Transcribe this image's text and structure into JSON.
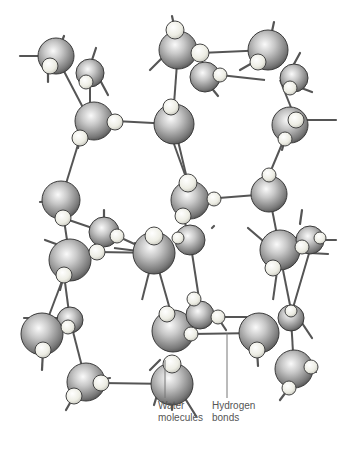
{
  "figure": {
    "labels": {
      "water_molecules": [
        "Water",
        "molecules"
      ],
      "hydrogen_bonds": [
        "Hydrogen",
        "bonds"
      ]
    },
    "colors": {
      "oxygen_light": "#f2f2f2",
      "oxygen_dark": "#555555",
      "hydrogen_light": "#f5f5ee",
      "hydrogen_dark": "#c8c8c0",
      "bond": "#555555",
      "leader_line": "#777777"
    },
    "oxygens": [
      {
        "x": 56,
        "y": 56,
        "r": 18
      },
      {
        "x": 90,
        "y": 73,
        "r": 14
      },
      {
        "x": 94,
        "y": 121,
        "r": 19
      },
      {
        "x": 178,
        "y": 50,
        "r": 19
      },
      {
        "x": 205,
        "y": 77,
        "r": 15
      },
      {
        "x": 268,
        "y": 50,
        "r": 20
      },
      {
        "x": 294,
        "y": 78,
        "r": 14
      },
      {
        "x": 174,
        "y": 124,
        "r": 20
      },
      {
        "x": 290,
        "y": 125,
        "r": 18
      },
      {
        "x": 61,
        "y": 200,
        "r": 19
      },
      {
        "x": 104,
        "y": 232,
        "r": 15
      },
      {
        "x": 70,
        "y": 260,
        "r": 21
      },
      {
        "x": 154,
        "y": 253,
        "r": 21
      },
      {
        "x": 190,
        "y": 200,
        "r": 19
      },
      {
        "x": 269,
        "y": 194,
        "r": 18
      },
      {
        "x": 190,
        "y": 240,
        "r": 15
      },
      {
        "x": 280,
        "y": 250,
        "r": 20
      },
      {
        "x": 310,
        "y": 240,
        "r": 14
      },
      {
        "x": 70,
        "y": 320,
        "r": 13
      },
      {
        "x": 42,
        "y": 334,
        "r": 21
      },
      {
        "x": 86,
        "y": 382,
        "r": 19
      },
      {
        "x": 173,
        "y": 331,
        "r": 21
      },
      {
        "x": 200,
        "y": 315,
        "r": 14
      },
      {
        "x": 259,
        "y": 333,
        "r": 20
      },
      {
        "x": 172,
        "y": 384,
        "r": 21
      },
      {
        "x": 294,
        "y": 369,
        "r": 19
      },
      {
        "x": 291,
        "y": 318,
        "r": 13
      }
    ],
    "hydrogens": [
      {
        "x": 50,
        "y": 66,
        "r": 8
      },
      {
        "x": 86,
        "y": 82,
        "r": 7
      },
      {
        "x": 115,
        "y": 122,
        "r": 8
      },
      {
        "x": 80,
        "y": 138,
        "r": 8
      },
      {
        "x": 175,
        "y": 30,
        "r": 9
      },
      {
        "x": 200,
        "y": 53,
        "r": 9
      },
      {
        "x": 220,
        "y": 75,
        "r": 7
      },
      {
        "x": 258,
        "y": 62,
        "r": 8
      },
      {
        "x": 290,
        "y": 88,
        "r": 7
      },
      {
        "x": 171,
        "y": 107,
        "r": 8
      },
      {
        "x": 296,
        "y": 120,
        "r": 8
      },
      {
        "x": 285,
        "y": 139,
        "r": 7
      },
      {
        "x": 188,
        "y": 183,
        "r": 9
      },
      {
        "x": 214,
        "y": 199,
        "r": 7
      },
      {
        "x": 269,
        "y": 175,
        "r": 7
      },
      {
        "x": 63,
        "y": 218,
        "r": 8
      },
      {
        "x": 117,
        "y": 236,
        "r": 7
      },
      {
        "x": 97,
        "y": 252,
        "r": 8
      },
      {
        "x": 64,
        "y": 275,
        "r": 8
      },
      {
        "x": 154,
        "y": 236,
        "r": 9
      },
      {
        "x": 178,
        "y": 238,
        "r": 6
      },
      {
        "x": 273,
        "y": 268,
        "r": 8
      },
      {
        "x": 302,
        "y": 247,
        "r": 7
      },
      {
        "x": 320,
        "y": 238,
        "r": 6
      },
      {
        "x": 183,
        "y": 216,
        "r": 8
      },
      {
        "x": 68,
        "y": 327,
        "r": 7
      },
      {
        "x": 43,
        "y": 350,
        "r": 8
      },
      {
        "x": 101,
        "y": 383,
        "r": 8
      },
      {
        "x": 74,
        "y": 396,
        "r": 8
      },
      {
        "x": 167,
        "y": 314,
        "r": 8
      },
      {
        "x": 194,
        "y": 299,
        "r": 7
      },
      {
        "x": 218,
        "y": 317,
        "r": 7
      },
      {
        "x": 191,
        "y": 334,
        "r": 7
      },
      {
        "x": 257,
        "y": 350,
        "r": 8
      },
      {
        "x": 172,
        "y": 364,
        "r": 9
      },
      {
        "x": 291,
        "y": 311,
        "r": 6
      },
      {
        "x": 311,
        "y": 367,
        "r": 7
      },
      {
        "x": 289,
        "y": 388,
        "r": 7
      }
    ],
    "bonds": [
      [
        56,
        56,
        90,
        121
      ],
      [
        90,
        82,
        90,
        121
      ],
      [
        115,
        121,
        172,
        124
      ],
      [
        174,
        104,
        178,
        50
      ],
      [
        200,
        53,
        268,
        50
      ],
      [
        220,
        75,
        265,
        80
      ],
      [
        280,
        80,
        294,
        115
      ],
      [
        174,
        124,
        188,
        183
      ],
      [
        269,
        175,
        290,
        125
      ],
      [
        80,
        138,
        61,
        200
      ],
      [
        117,
        236,
        154,
        253
      ],
      [
        104,
        232,
        63,
        218
      ],
      [
        154,
        253,
        173,
        320
      ],
      [
        206,
        199,
        269,
        194
      ],
      [
        188,
        183,
        174,
        144
      ],
      [
        190,
        240,
        183,
        216
      ],
      [
        269,
        194,
        280,
        250
      ],
      [
        114,
        248,
        154,
        253
      ],
      [
        97,
        252,
        160,
        253
      ],
      [
        61,
        200,
        70,
        260
      ],
      [
        64,
        275,
        70,
        320
      ],
      [
        70,
        260,
        42,
        334
      ],
      [
        70,
        320,
        86,
        382
      ],
      [
        101,
        383,
        172,
        384
      ],
      [
        218,
        317,
        259,
        317
      ],
      [
        191,
        334,
        259,
        333
      ],
      [
        280,
        250,
        273,
        300
      ],
      [
        310,
        250,
        290,
        318
      ],
      [
        291,
        318,
        294,
        369
      ],
      [
        190,
        240,
        200,
        305
      ],
      [
        154,
        253,
        142,
        300
      ],
      [
        283,
        270,
        295,
        330
      ]
    ],
    "stubs": [
      [
        56,
        56,
        64,
        36
      ],
      [
        38,
        56,
        20,
        56
      ],
      [
        48,
        70,
        48,
        82
      ],
      [
        92,
        60,
        96,
        48
      ],
      [
        100,
        80,
        108,
        95
      ],
      [
        80,
        138,
        78,
        148
      ],
      [
        175,
        30,
        172,
        16
      ],
      [
        162,
        58,
        150,
        70
      ],
      [
        210,
        86,
        218,
        96
      ],
      [
        268,
        50,
        274,
        22
      ],
      [
        254,
        62,
        240,
        70
      ],
      [
        294,
        64,
        300,
        53
      ],
      [
        296,
        86,
        312,
        92
      ],
      [
        304,
        120,
        336,
        120
      ],
      [
        285,
        139,
        282,
        150
      ],
      [
        61,
        200,
        40,
        202
      ],
      [
        104,
        220,
        104,
        210
      ],
      [
        56,
        244,
        45,
        240
      ],
      [
        64,
        275,
        60,
        290
      ],
      [
        138,
        255,
        135,
        243
      ],
      [
        160,
        241,
        164,
        236
      ],
      [
        212,
        228,
        214,
        226
      ],
      [
        248,
        228,
        262,
        240
      ],
      [
        300,
        224,
        302,
        210
      ],
      [
        320,
        240,
        336,
        240
      ],
      [
        310,
        253,
        328,
        254
      ],
      [
        62,
        318,
        24,
        318
      ],
      [
        43,
        350,
        42,
        370
      ],
      [
        74,
        396,
        66,
        410
      ],
      [
        86,
        382,
        110,
        378
      ],
      [
        160,
        360,
        150,
        370
      ],
      [
        173,
        364,
        172,
        378
      ],
      [
        218,
        318,
        226,
        330
      ],
      [
        257,
        350,
        258,
        366
      ],
      [
        294,
        369,
        316,
        372
      ],
      [
        289,
        388,
        280,
        400
      ],
      [
        300,
        320,
        312,
        338
      ],
      [
        172,
        384,
        172,
        410
      ],
      [
        158,
        392,
        154,
        405
      ],
      [
        186,
        400,
        196,
        416
      ]
    ],
    "leaders": {
      "water": [
        165,
        360,
        165,
        398
      ],
      "hydrogen": [
        227,
        333,
        227,
        398
      ]
    }
  }
}
